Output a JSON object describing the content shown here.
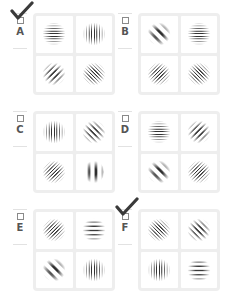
{
  "question": {
    "options": [
      {
        "letter": "A",
        "checked": true,
        "cells": [
          {
            "orientation": "horizontal",
            "angle": 0,
            "frequency": "high"
          },
          {
            "orientation": "vertical",
            "angle": 90,
            "frequency": "high"
          },
          {
            "orientation": "diagonal-up",
            "angle": 135,
            "frequency": "mid"
          },
          {
            "orientation": "diagonal-down",
            "angle": 45,
            "frequency": "high"
          }
        ]
      },
      {
        "letter": "B",
        "checked": false,
        "cells": [
          {
            "orientation": "diagonal-down",
            "angle": 45,
            "frequency": "low"
          },
          {
            "orientation": "horizontal",
            "angle": 0,
            "frequency": "high"
          },
          {
            "orientation": "diagonal-up",
            "angle": 135,
            "frequency": "high"
          },
          {
            "orientation": "diagonal-down",
            "angle": 45,
            "frequency": "high"
          }
        ]
      },
      {
        "letter": "C",
        "checked": false,
        "cells": [
          {
            "orientation": "vertical",
            "angle": 90,
            "frequency": "high"
          },
          {
            "orientation": "diagonal-down",
            "angle": 45,
            "frequency": "mid"
          },
          {
            "orientation": "diagonal-up",
            "angle": 135,
            "frequency": "high"
          },
          {
            "orientation": "vertical",
            "angle": 90,
            "frequency": "low"
          }
        ]
      },
      {
        "letter": "D",
        "checked": false,
        "cells": [
          {
            "orientation": "horizontal",
            "angle": 0,
            "frequency": "high"
          },
          {
            "orientation": "diagonal-up",
            "angle": 135,
            "frequency": "mid"
          },
          {
            "orientation": "diagonal-down",
            "angle": 45,
            "frequency": "low"
          },
          {
            "orientation": "diagonal-up",
            "angle": 135,
            "frequency": "high"
          }
        ]
      },
      {
        "letter": "E",
        "checked": false,
        "cells": [
          {
            "orientation": "diagonal-up",
            "angle": 135,
            "frequency": "high"
          },
          {
            "orientation": "horizontal",
            "angle": 0,
            "frequency": "mid"
          },
          {
            "orientation": "diagonal-down",
            "angle": 45,
            "frequency": "low"
          },
          {
            "orientation": "vertical",
            "angle": 90,
            "frequency": "high"
          }
        ]
      },
      {
        "letter": "F",
        "checked": true,
        "cells": [
          {
            "orientation": "diagonal-down",
            "angle": 45,
            "frequency": "high"
          },
          {
            "orientation": "diagonal-down",
            "angle": 45,
            "frequency": "mid"
          },
          {
            "orientation": "vertical",
            "angle": 90,
            "frequency": "high"
          },
          {
            "orientation": "horizontal",
            "angle": 0,
            "frequency": "mid"
          }
        ]
      }
    ]
  },
  "colors": {
    "grid_border": "#eeeeee",
    "cell_background": "#ffffff",
    "stripe_dark": "#333333",
    "checkmark": "#3a3a3a",
    "letter": "#555555"
  }
}
